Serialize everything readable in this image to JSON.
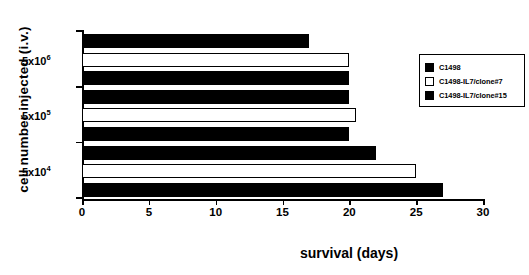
{
  "chart_data": {
    "type": "bar",
    "orientation": "horizontal",
    "title": "",
    "xlabel": "survival (days)",
    "ylabel": "cell number injected (i.v.)",
    "xlim": [
      0,
      30
    ],
    "xticks": [
      0,
      5,
      10,
      15,
      20,
      25,
      30
    ],
    "grid": false,
    "legend_position": "right",
    "categories": [
      "5x10^6",
      "5x10^5",
      "5x10^4"
    ],
    "category_labels": [
      {
        "mantissa": "5x10",
        "exponent": "6"
      },
      {
        "mantissa": "5x10",
        "exponent": "5"
      },
      {
        "mantissa": "5x10",
        "exponent": "4"
      }
    ],
    "series": [
      {
        "name": "C1498",
        "fill": "filled",
        "values": [
          17,
          20,
          22
        ]
      },
      {
        "name": "C1498-IL7/clone#7",
        "fill": "open",
        "values": [
          20,
          20.5,
          25
        ]
      },
      {
        "name": "C1498-IL7/clone#15",
        "fill": "filled",
        "values": [
          20,
          20,
          27
        ]
      }
    ],
    "bars": [
      {
        "group": "5x10^6",
        "series": "C1498",
        "fill": "filled",
        "value": 17
      },
      {
        "group": "5x10^6",
        "series": "C1498-IL7/clone#7",
        "fill": "open",
        "value": 20
      },
      {
        "group": "5x10^6",
        "series": "C1498-IL7/clone#15",
        "fill": "filled",
        "value": 20
      },
      {
        "group": "5x10^5",
        "series": "C1498",
        "fill": "filled",
        "value": 20
      },
      {
        "group": "5x10^5",
        "series": "C1498-IL7/clone#7",
        "fill": "open",
        "value": 20.5
      },
      {
        "group": "5x10^5",
        "series": "C1498-IL7/clone#15",
        "fill": "filled",
        "value": 20
      },
      {
        "group": "5x10^4",
        "series": "C1498",
        "fill": "filled",
        "value": 22
      },
      {
        "group": "5x10^4",
        "series": "C1498-IL7/clone#7",
        "fill": "open",
        "value": 25
      },
      {
        "group": "5x10^4",
        "series": "C1498-IL7/clone#15",
        "fill": "filled",
        "value": 27
      }
    ],
    "colors": {
      "filled": "#000000",
      "open": "#ffffff",
      "axis": "#000000",
      "background": "#ffffff"
    }
  },
  "axes": {
    "x": {
      "label": "survival (days)",
      "tick_labels": [
        "0",
        "5",
        "10",
        "15",
        "20",
        "25",
        "30"
      ]
    },
    "y": {
      "label": "cell number injected (i.v.)",
      "tick_labels": [
        "5x10 6",
        "5x10 5",
        "5x10 4"
      ]
    }
  },
  "legend": {
    "entries": [
      {
        "label": "C1498",
        "fill": "filled"
      },
      {
        "label": "C1498-IL7/clone#7",
        "fill": "open"
      },
      {
        "label": "C1498-IL7/clone#15",
        "fill": "filled"
      }
    ]
  }
}
